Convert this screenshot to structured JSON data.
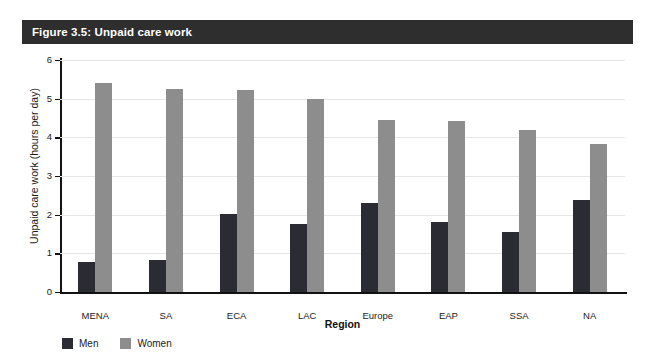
{
  "figure": {
    "title": "Figure 3.5: Unpaid care work",
    "title_bar_color": "#2e2e2e",
    "title_text_color": "#ffffff"
  },
  "legend": {
    "position": "below-left",
    "items": [
      {
        "label": "Men",
        "color": "#2b2b33",
        "swatch_name": "legend-swatch-men"
      },
      {
        "label": "Women",
        "color": "#8d8d8d",
        "swatch_name": "legend-swatch-women"
      }
    ]
  },
  "chart_data": {
    "type": "bar",
    "title": "Figure 3.5: Unpaid care work",
    "subtitle": "",
    "xlabel": "Region",
    "ylabel": "Unpaid care work (hours per day)",
    "categories": [
      "MENA",
      "SA",
      "ECA",
      "LAC",
      "Europe",
      "EAP",
      "SSA",
      "NA"
    ],
    "series": [
      {
        "name": "Men",
        "color": "#2b2b33",
        "values": [
          0.78,
          0.82,
          2.02,
          1.75,
          2.3,
          1.82,
          1.56,
          2.38
        ]
      },
      {
        "name": "Women",
        "color": "#8d8d8d",
        "values": [
          5.4,
          5.25,
          5.22,
          5.0,
          4.45,
          4.43,
          4.18,
          3.82
        ]
      }
    ],
    "ylim": [
      0,
      6
    ],
    "yticks": [
      0,
      1,
      2,
      3,
      4,
      5,
      6
    ],
    "ytick_labels": [
      "0",
      "1",
      "2",
      "3",
      "4",
      "5",
      "6"
    ],
    "xtick_labels": [
      "MENA",
      "SA",
      "ECA",
      "LAC",
      "Europe",
      "EAP",
      "SSA",
      "NA"
    ],
    "grid": "horizontal",
    "grid_color": "#e6e6e6",
    "legend_position": "below-left",
    "annotations": []
  }
}
